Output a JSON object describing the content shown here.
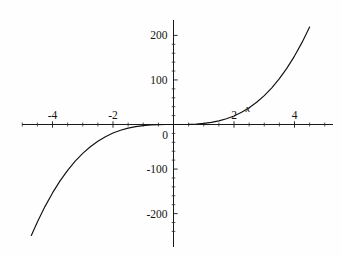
{
  "chart_data": {
    "type": "line",
    "title": "",
    "subtitle": "",
    "xlabel": "x",
    "ylabel": "",
    "xlim": [
      -5.05,
      5.3
    ],
    "ylim": [
      -245,
      215
    ],
    "grid": false,
    "legend": null,
    "function_expression": "y = 2.4 x^3",
    "x_ticks_major": [
      -4,
      -2,
      2,
      4
    ],
    "x_tick_labels": [
      "-4",
      "-2",
      "2",
      "4"
    ],
    "x_tick_step_minor": 0.5,
    "y_ticks_major": [
      -200,
      -100,
      0,
      100,
      200
    ],
    "y_tick_labels": [
      "-200",
      "-100",
      "0",
      "100",
      "200"
    ],
    "y_tick_step_minor": 20,
    "origin_label": "0",
    "x": [
      -4.7,
      -4.5,
      -4.25,
      -4.0,
      -3.75,
      -3.5,
      -3.25,
      -3.0,
      -2.75,
      -2.5,
      -2.25,
      -2.0,
      -1.75,
      -1.5,
      -1.25,
      -1.0,
      -0.75,
      -0.5,
      -0.25,
      0,
      0.25,
      0.5,
      0.75,
      1.0,
      1.25,
      1.5,
      1.75,
      2.0,
      2.25,
      2.5,
      2.75,
      3.0,
      3.25,
      3.5,
      3.75,
      4.0,
      4.25,
      4.5,
      4.75,
      5.0,
      5.15
    ],
    "y": [
      -249.2,
      -218.7,
      -184.3,
      -153.6,
      -126.6,
      -102.9,
      -82.4,
      -64.8,
      -49.9,
      -37.5,
      -27.3,
      -19.2,
      -12.9,
      -8.1,
      -4.7,
      -2.4,
      -1.0,
      -0.3,
      -0.04,
      0,
      0.04,
      0.3,
      1.0,
      2.4,
      4.7,
      8.1,
      12.9,
      19.2,
      27.3,
      37.5,
      49.9,
      64.8,
      82.4,
      102.9,
      126.6,
      153.6,
      184.3,
      218.7,
      257.2,
      300.0,
      327.7
    ],
    "series": [
      {
        "name": "cubic",
        "color": "#111111",
        "style": "solid"
      }
    ],
    "annotations": []
  },
  "figure": {
    "background_color": "#fefefe",
    "axis_color": "#1a1a1a",
    "curve_color": "#111111",
    "text_color": "#141414"
  }
}
